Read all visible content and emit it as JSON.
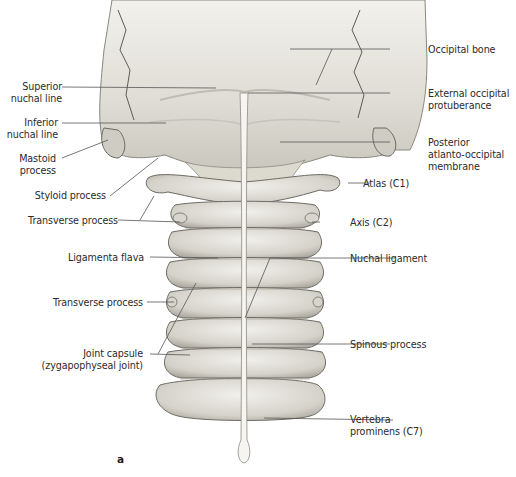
{
  "figure": {
    "panel_letter": "a",
    "labels_left": [
      {
        "id": "superior-nuchal-line",
        "text": "Superior\nnuchal line"
      },
      {
        "id": "inferior-nuchal-line",
        "text": "Inferior\nnuchal line"
      },
      {
        "id": "mastoid-process",
        "text": "Mastoid\nprocess"
      },
      {
        "id": "styloid-process",
        "text": "Styloid process"
      },
      {
        "id": "transverse-process-upper",
        "text": "Transverse process"
      },
      {
        "id": "ligamenta-flava",
        "text": "Ligamenta flava"
      },
      {
        "id": "transverse-process-lower",
        "text": "Transverse process"
      },
      {
        "id": "joint-capsule",
        "text": "Joint capsule\n(zygapophyseal joint)"
      }
    ],
    "labels_right": [
      {
        "id": "occipital-bone",
        "text": "Occipital bone"
      },
      {
        "id": "external-occipital-protuberance",
        "text": "External occipital\nprotuberance"
      },
      {
        "id": "posterior-atlanto-occipital-membrane",
        "text": "Posterior\natlanto-occipital\nmembrane"
      },
      {
        "id": "atlas-c1",
        "text": "Atlas (C1)"
      },
      {
        "id": "axis-c2",
        "text": "Axis (C2)"
      },
      {
        "id": "nuchal-ligament",
        "text": "Nuchal ligament"
      },
      {
        "id": "spinous-process",
        "text": "Spinous process"
      },
      {
        "id": "vertebra-prominens-c7",
        "text": "Vertebra\nprominens (C7)"
      }
    ],
    "colors": {
      "bone": "#e4e2da",
      "bone_shade": "#b9b6ad",
      "outline": "#7d7a73",
      "leader": "#555555",
      "text": "#2b2b2b"
    }
  }
}
